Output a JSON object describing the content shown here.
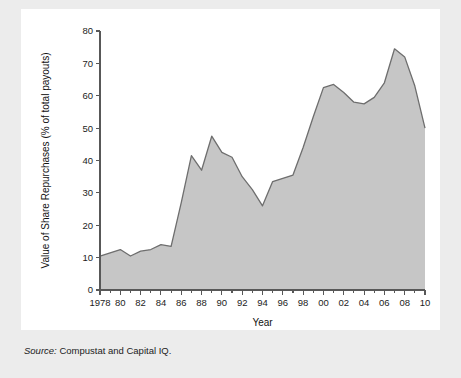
{
  "figure": {
    "source_label": "Source:",
    "source_text": " Compustat and Capital IQ."
  },
  "colors": {
    "page_background": "#ececec",
    "panel_background": "#ffffff",
    "area_fill": "#c6c6c6",
    "area_stroke": "#6e6e6e",
    "axis": "#585858",
    "text": "#1c1c1c"
  },
  "chart_data": {
    "type": "area",
    "title": "",
    "xlabel": "Year",
    "ylabel": "Value of Share Repurchases (% of total payouts)",
    "xlim": [
      1978,
      2010
    ],
    "ylim": [
      0,
      80
    ],
    "grid": false,
    "legend": null,
    "y_ticks": [
      0,
      10,
      20,
      30,
      40,
      50,
      60,
      70,
      80
    ],
    "y_tick_labels": [
      "0",
      "10",
      "20",
      "30",
      "40",
      "50",
      "60",
      "70",
      "80"
    ],
    "x_ticks": [
      1978,
      1980,
      1982,
      1984,
      1986,
      1988,
      1990,
      1992,
      1994,
      1996,
      1998,
      2000,
      2002,
      2004,
      2006,
      2008,
      2010
    ],
    "x_tick_labels": [
      "1978",
      "80",
      "82",
      "84",
      "86",
      "88",
      "90",
      "92",
      "94",
      "96",
      "98",
      "00",
      "02",
      "04",
      "06",
      "08",
      "10"
    ],
    "x_minor_tick_step": 1,
    "x": [
      1978,
      1979,
      1980,
      1981,
      1982,
      1983,
      1984,
      1985,
      1986,
      1987,
      1988,
      1989,
      1990,
      1991,
      1992,
      1993,
      1994,
      1995,
      1996,
      1997,
      1998,
      1999,
      2000,
      2001,
      2002,
      2003,
      2004,
      2005,
      2006,
      2007,
      2008,
      2009,
      2010
    ],
    "values": [
      10.5,
      11.5,
      12.5,
      10.5,
      12.0,
      12.5,
      14.0,
      13.5,
      27.0,
      41.5,
      37.0,
      47.5,
      42.5,
      41.0,
      35.0,
      31.0,
      26.0,
      33.5,
      34.5,
      35.5,
      44.0,
      53.5,
      62.5,
      63.5,
      61.0,
      58.0,
      57.5,
      59.5,
      64.0,
      74.5,
      72.0,
      63.0,
      50.0
    ],
    "series_name": "Value of Share Repurchases (% of total payouts)"
  }
}
